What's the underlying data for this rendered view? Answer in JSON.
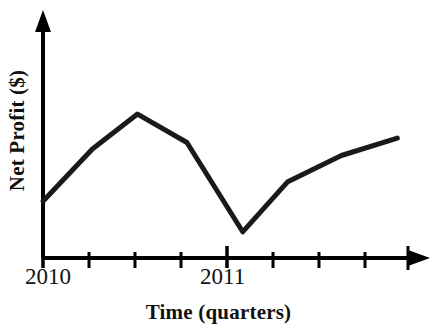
{
  "chart_data": {
    "type": "line",
    "title": "",
    "subtitle": "",
    "xlabel": "Time (quarters)",
    "ylabel": "Net Profit ($)",
    "grid": false,
    "legend": false,
    "legend_position": "none",
    "axis_style": "arrow-headed open axes, no y tick labels",
    "x_tick_labels": [
      "2010",
      "2011"
    ],
    "x_tick_label_positions": [
      0,
      4
    ],
    "x_tick_count": 9,
    "y_tick_labels": [],
    "xlim": [
      0,
      8.5
    ],
    "ylim": [
      0,
      10
    ],
    "series": [
      {
        "name": "Net Profit",
        "color": "#1a1a1a",
        "line_width": 5,
        "x": [
          0,
          1.15,
          2.2,
          3.35,
          4.65,
          5.7,
          6.95,
          8.25
        ],
        "values": [
          2.6,
          5.0,
          6.6,
          5.3,
          1.2,
          3.5,
          4.7,
          5.5
        ],
        "points_description": [
          "start low at 2010 axis",
          "rise sharply through first quarter",
          "peak mid-2010",
          "gentle decline late 2010",
          "sharp drop to trough just after 2011",
          "sharp recovery",
          "continued gradual rise",
          "flattening rise to end of range"
        ]
      }
    ],
    "annotations": []
  },
  "axes": {
    "y_axis_label": "Net Profit ($)",
    "x_axis_label": "Time (quarters)"
  },
  "ticks": {
    "label_2010": "2010",
    "label_2011": "2011"
  },
  "colors": {
    "line": "#1a1a1a",
    "axis": "#000000",
    "background": "#ffffff",
    "text": "#111111"
  }
}
